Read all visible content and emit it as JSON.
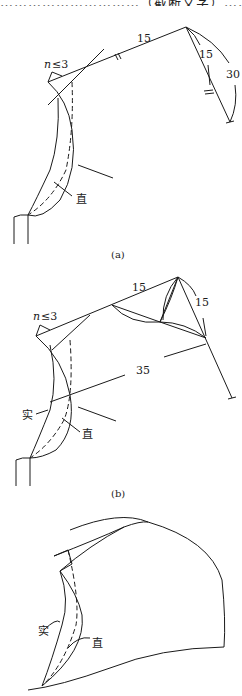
{
  "header": {
    "cut_text": "…………………………（截断文字）…………"
  },
  "figures": [
    {
      "id": "a",
      "caption": "(a)",
      "labels": {
        "n_label_var": "n",
        "n_label_rest": "≤3",
        "dim_top": "15",
        "dim_side": "15",
        "dim_arc": "30",
        "straight": "直"
      }
    },
    {
      "id": "b",
      "caption": "(b)",
      "labels": {
        "n_label_var": "n",
        "n_label_rest": "≤3",
        "dim_top": "15",
        "dim_side": "15",
        "dim_long": "35",
        "solid": "实",
        "straight": "直"
      }
    },
    {
      "id": "c",
      "caption": "",
      "labels": {
        "solid": "实",
        "straight": "直"
      }
    }
  ]
}
